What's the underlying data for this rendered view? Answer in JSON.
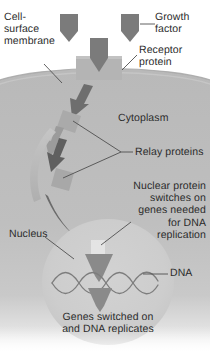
{
  "diagram": {
    "type": "biology-cell-signalling-diagram",
    "canvas": {
      "width": 210,
      "height": 355
    }
  },
  "labels": {
    "cell_surface_membrane": "Cell-\nsurface\nmembrane",
    "growth_factor": "Growth\nfactor",
    "receptor_protein": "Receptor\nprotein",
    "cytoplasm": "Cytoplasm",
    "relay_proteins": "Relay proteins",
    "nuclear_protein": "Nuclear protein\nswitches on\ngenes needed\nfor DNA\nreplication",
    "nucleus": "Nucleus",
    "dna": "DNA",
    "genes_switched_on": "Genes switched on\nand DNA replicates"
  },
  "colors": {
    "background": "#ffffff",
    "cell_body": "#b9b9b9",
    "cell_body_light": "#c4c4c4",
    "nucleus": "#cccccc",
    "receptor_protein": "#b0b0b0",
    "growth_factor": "#7b7b7b",
    "relay_protein": "#a8a8a8",
    "arrow_dark": "#6e6e6e",
    "arrow_mid": "#8f8f8f",
    "arrow_light": "#b4b4b4",
    "dna_strand": "#7d7d7d",
    "text": "#2b2b2b",
    "leader_line": "#5a5a5a"
  },
  "elements": {
    "growth_factors": [
      {
        "name": "growth-factor-left",
        "x": 60,
        "y": 14
      },
      {
        "name": "growth-factor-right",
        "x": 121,
        "y": 14
      },
      {
        "name": "growth-factor-bound",
        "x": 90,
        "y": 36
      }
    ],
    "relay_proteins": [
      {
        "name": "relay-protein-upper",
        "x": 62,
        "y": 112
      },
      {
        "name": "relay-protein-lower",
        "x": 56,
        "y": 172
      }
    ],
    "cascade_arrows": [
      {
        "name": "cascade-arrow-1",
        "shade": "dark"
      },
      {
        "name": "cascade-arrow-2",
        "shade": "mid"
      },
      {
        "name": "cascade-arrow-3",
        "shade": "dark"
      },
      {
        "name": "cascade-arrow-4",
        "shade": "light"
      },
      {
        "name": "cascade-arrow-5",
        "shade": "dark"
      }
    ],
    "nucleus_arrows": [
      {
        "name": "nucleus-arrow-upper"
      },
      {
        "name": "nucleus-arrow-lower"
      }
    ],
    "dna_helix": {
      "name": "dna-double-helix",
      "crossings": 5
    }
  }
}
